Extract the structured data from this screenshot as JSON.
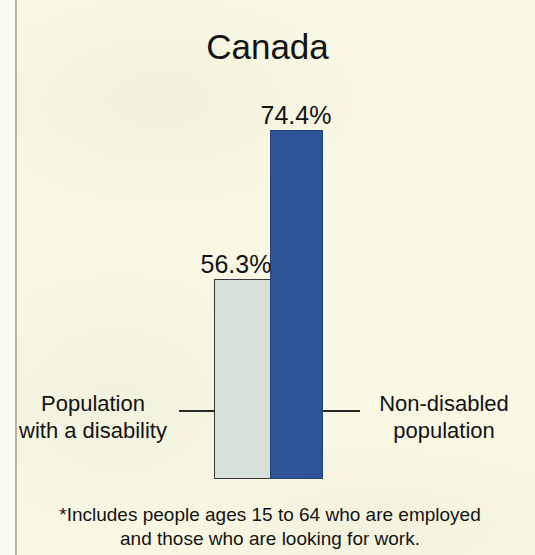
{
  "chart_data": {
    "type": "bar",
    "title": "Canada",
    "xlabel": "",
    "ylabel": "",
    "categories": [
      "Population with a disability",
      "Non-disabled population"
    ],
    "values": [
      56.3,
      74.4
    ],
    "value_labels": [
      "56.3%",
      "74.4%"
    ],
    "units": "percent",
    "grid": false,
    "legend": "none",
    "axis_visible": false,
    "baseline_truncated": true,
    "series": [
      {
        "name": "Employment rate",
        "values": [
          56.3,
          74.4
        ],
        "colors": [
          "#d6e0d7",
          "#2d5499"
        ]
      }
    ],
    "annotations": [
      "*Includes people ages 15 to 64 who are employed and those who are looking for work."
    ]
  },
  "title": {
    "text": "Canada"
  },
  "bars": [
    {
      "key": "disability",
      "category_line1": "Population",
      "category_line2": "with a disability",
      "value_label": "56.3%",
      "color": "#d6e0d7"
    },
    {
      "key": "nondisabled",
      "category_line1": "Non-disabled",
      "category_line2": "population",
      "value_label": "74.4%",
      "color": "#2d5499"
    }
  ],
  "footnote": {
    "line1": "*Includes people ages 15 to 64 who are employed",
    "line2": "and those who are looking for work."
  },
  "colors": {
    "background": "#f8f8e4",
    "text": "#131313",
    "bar_light": "#d6e0d7",
    "bar_blue": "#2d5499",
    "leader_line": "#2a2a2a"
  }
}
